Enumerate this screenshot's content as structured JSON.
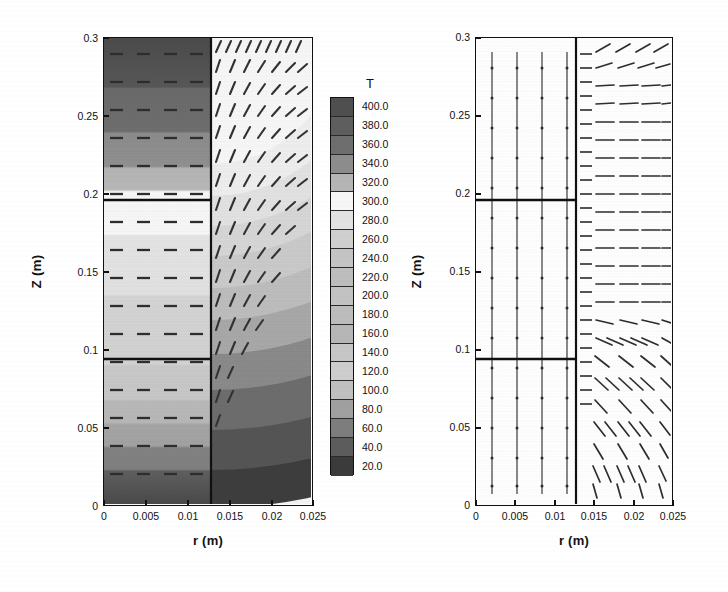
{
  "figure": {
    "type": "scientific-figure"
  },
  "colorbar": {
    "title": "T",
    "levels": [
      "400.0",
      "380.0",
      "360.0",
      "340.0",
      "320.0",
      "300.0",
      "280.0",
      "260.0",
      "240.0",
      "220.0",
      "200.0",
      "180.0",
      "160.0",
      "140.0",
      "120.0",
      "100.0",
      "80.0",
      "60.0",
      "40.0",
      "20.0"
    ],
    "swatches": [
      "#4f4f4f",
      "#5e5e5e",
      "#6e6e6e",
      "#8d8d8d",
      "#b5b5b5",
      "#f6f6f6",
      "#e2e2e2",
      "#cfcfcf",
      "#c4c4c4",
      "#bdbdbd",
      "#c2c2c2",
      "#bcbcbc",
      "#b6b6b6",
      "#c6c6c6",
      "#cdcdcd",
      "#c0c0c0",
      "#a0a0a0",
      "#7d7d7d",
      "#5c5c5c",
      "#3b3b3b"
    ],
    "min": "20.0",
    "max": "400.0",
    "step": "20.0"
  },
  "left_panel": {
    "name": "temperature-contour-panel",
    "xlabel": "r (m)",
    "ylabel": "Z (m)",
    "xticks": [
      "0",
      "0.005",
      "0.01",
      "0.015",
      "0.02",
      "0.025"
    ],
    "yticks": [
      "0",
      "0.05",
      "0.1",
      "0.15",
      "0.2",
      "0.25",
      "0.3"
    ],
    "xlim": [
      0,
      0.025
    ],
    "ylim": [
      0,
      0.3
    ],
    "interface_r": 0.0128,
    "horizontal_lines_z": [
      0.1,
      0.2
    ]
  },
  "right_panel": {
    "name": "velocity-vector-panel",
    "xlabel": "r (m)",
    "ylabel": "Z (m)",
    "xticks": [
      "0",
      "0.005",
      "0.01",
      "0.015",
      "0.02",
      "0.025"
    ],
    "yticks": [
      "0",
      "0.05",
      "0.1",
      "0.15",
      "0.2",
      "0.25",
      "0.3"
    ],
    "xlim": [
      0,
      0.025
    ],
    "ylim": [
      0,
      0.3
    ],
    "interface_r": 0.0128,
    "horizontal_lines_z": [
      0.1,
      0.2
    ]
  },
  "chart_data": {
    "type": "heatmap",
    "title": "",
    "xlabel": "r (m)",
    "ylabel": "Z (m)",
    "legend_title": "T",
    "xlim": [
      0,
      0.025
    ],
    "ylim": [
      0,
      0.3
    ],
    "xticks": [
      0,
      0.005,
      0.01,
      0.015,
      0.02,
      0.025
    ],
    "yticks": [
      0,
      0.05,
      0.1,
      0.15,
      0.2,
      0.25,
      0.3
    ],
    "colorbar_levels": [
      20,
      40,
      60,
      80,
      100,
      120,
      140,
      160,
      180,
      200,
      220,
      240,
      260,
      280,
      300,
      320,
      340,
      360,
      380,
      400
    ],
    "inner_region_temperature_profile": [
      {
        "z": 0.3,
        "T": 400
      },
      {
        "z": 0.275,
        "T": 390
      },
      {
        "z": 0.25,
        "T": 370
      },
      {
        "z": 0.235,
        "T": 350
      },
      {
        "z": 0.215,
        "T": 330
      },
      {
        "z": 0.2,
        "T": 315
      },
      {
        "z": 0.175,
        "T": 300
      },
      {
        "z": 0.15,
        "T": 290
      },
      {
        "z": 0.125,
        "T": 285
      },
      {
        "z": 0.1,
        "T": 280
      },
      {
        "z": 0.08,
        "T": 240
      },
      {
        "z": 0.065,
        "T": 180
      },
      {
        "z": 0.05,
        "T": 120
      },
      {
        "z": 0.03,
        "T": 60
      },
      {
        "z": 0.0,
        "T": 20
      }
    ],
    "outer_region_corner_gradient": "concentric arcs centered near (r=0.0128, z=0.3); temperature falls from ~320 near the interface top to ~20 at the bottom-right corner (r=0.025, z=0)",
    "vectors_left_inner": "short horizontal dashed segments, near-zero vertical motion",
    "vectors_left_outer": "upward-inclined strokes rising along the interface, tilting toward the outer wall",
    "vectors_right_inner": "small downward/vertical arrows on four evenly spaced columns",
    "vectors_right_outer": "long horizontal arrows pointing outward in the upper region, turning to steep down-left arrows near the bottom"
  }
}
